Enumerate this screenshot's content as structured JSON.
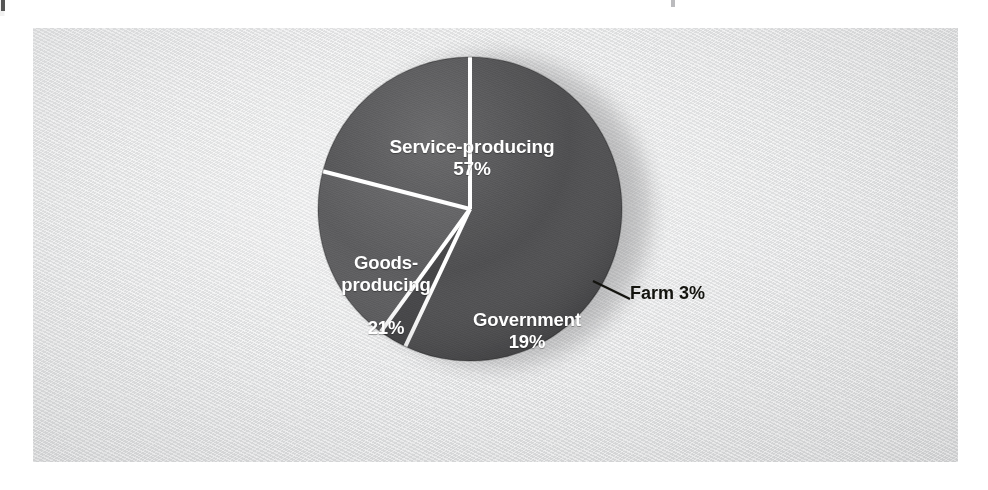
{
  "figure": {
    "background_color": "#ffffff",
    "panel_color": "#e3e4e5"
  },
  "chart_data": {
    "type": "pie",
    "title": "",
    "subtitle": "",
    "xlabel": "",
    "ylabel": "",
    "legend_position": "none",
    "grid": false,
    "units": "percent",
    "total": 100,
    "categories": [
      "Service-producing",
      "Farm",
      "Government",
      "Goods-producing"
    ],
    "values": [
      57,
      3,
      19,
      21
    ],
    "labels": [
      "Service-producing\n57%",
      "Farm 3%",
      "Government\n19%",
      "Goods-\nproducing\n21%"
    ],
    "start_angle_deg": 0,
    "direction": "clockwise",
    "slices": [
      {
        "name": "Service-producing",
        "value": 57,
        "value_text": "57%",
        "label_text": "Service-producing",
        "color": "#4a4a4c",
        "start_deg": 0,
        "end_deg": 205.2,
        "label_placement": "inside",
        "label_color": "#ffffff"
      },
      {
        "name": "Farm",
        "value": 3,
        "value_text": "3%",
        "label_text": "Farm",
        "callout_text": "Farm 3%",
        "color": "#3f3f41",
        "start_deg": 205.2,
        "end_deg": 216.0,
        "label_placement": "callout",
        "label_color": "#14140f"
      },
      {
        "name": "Government",
        "value": 19,
        "value_text": "19%",
        "label_text": "Government",
        "color": "#58585a",
        "start_deg": 216.0,
        "end_deg": 284.4,
        "label_placement": "inside",
        "label_color": "#ffffff"
      },
      {
        "name": "Goods-producing",
        "value": 21,
        "value_text": "21%",
        "label_text": "Goods-producing",
        "color": "#4f4f51",
        "start_deg": 284.4,
        "end_deg": 360.0,
        "label_placement": "inside",
        "label_color": "#ffffff"
      }
    ],
    "separator_color": "#ffffff",
    "separator_width_px": 4
  },
  "labels": {
    "service": {
      "name": "Service-producing",
      "percent": "57%"
    },
    "goods": {
      "line1": "Goods-",
      "line2": "producing",
      "percent": "21%"
    },
    "government": {
      "name": "Government",
      "percent": "19%"
    },
    "farm": {
      "callout": "Farm 3%"
    }
  }
}
